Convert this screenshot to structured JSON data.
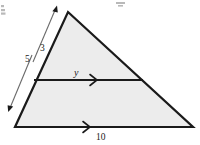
{
  "figure": {
    "problem_number": "2.",
    "title_mark": "",
    "shape": "triangle",
    "fill_color": "#ececec",
    "stroke_color": "#1a1a1a",
    "measure_line_color": "#666666"
  },
  "labels": {
    "upper_side": "3",
    "full_side": "5",
    "midsegment": "y",
    "base": "10"
  },
  "geometry": {
    "apex": {
      "x": 68,
      "y": 12
    },
    "bottom_left": {
      "x": 15,
      "y": 127
    },
    "bottom_right": {
      "x": 193,
      "y": 127
    },
    "midline_left": {
      "x": 34,
      "y": 80
    },
    "midline_right": {
      "x": 143,
      "y": 80
    }
  },
  "measures": [
    {
      "name": "upper-measure",
      "label": "3",
      "from": {
        "x": 34,
        "y": 60
      },
      "to": {
        "x": 57,
        "y": 7
      }
    },
    {
      "name": "full-measure",
      "label": "5",
      "from": {
        "x": 9,
        "y": 111
      },
      "to": {
        "x": 33,
        "y": 53
      }
    }
  ],
  "arrow_markers": {
    "midsegment": {
      "x": 95,
      "y": 80
    },
    "base": {
      "x": 88,
      "y": 127
    }
  }
}
